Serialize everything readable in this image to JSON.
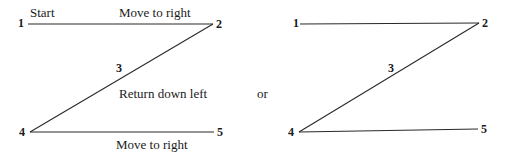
{
  "left_diagram": {
    "vertices": {
      "v1": "1",
      "v2": "2",
      "v3": "3",
      "v4": "4",
      "v5": "5"
    },
    "labels": {
      "start": "Start",
      "top_move": "Move to right",
      "diagonal": "Return down left",
      "bottom_move": "Move to right"
    }
  },
  "separator": "or",
  "right_diagram": {
    "vertices": {
      "v1": "1",
      "v2": "2",
      "v3": "3",
      "v4": "4",
      "v5": "5"
    }
  },
  "colors": {
    "line": "#2a2a2a",
    "text": "#1a1a1a"
  }
}
